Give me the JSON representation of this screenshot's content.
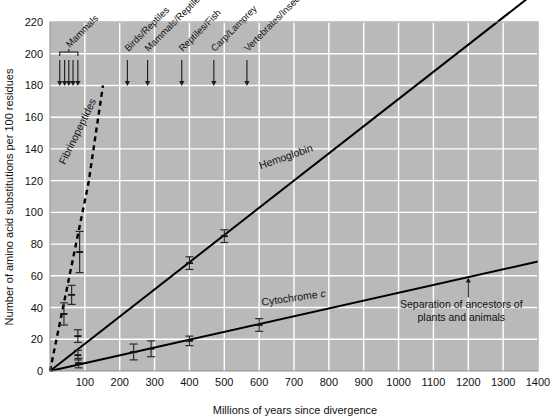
{
  "chart_data": {
    "type": "line",
    "title": "",
    "xlabel": "Millions of years since divergence",
    "ylabel": "Number of amino acid substitutions per 100 residues",
    "xlim": [
      0,
      1400
    ],
    "ylim": [
      0,
      220
    ],
    "xticks": [
      0,
      100,
      200,
      300,
      400,
      500,
      600,
      700,
      800,
      900,
      1000,
      1100,
      1200,
      1300,
      1400
    ],
    "xticklabels": [
      "",
      "100",
      "200",
      "300",
      "400",
      "500",
      "600",
      "700",
      "800",
      "900",
      "1000",
      "1100",
      "1200",
      "1300",
      "1400"
    ],
    "yticks": [
      0,
      20,
      40,
      60,
      80,
      100,
      120,
      140,
      160,
      180,
      200,
      220
    ],
    "yticklabels": [
      "0",
      "20",
      "40",
      "60",
      "80",
      "100",
      "120",
      "140",
      "160",
      "180",
      "200",
      "220"
    ],
    "grid": true,
    "grid_color": "#ffffff",
    "plot_bg": "#b9b9b9",
    "legend_position": "inline-labels",
    "series": [
      {
        "name": "Fibrinopeptides",
        "label": "Fibrinopeptides",
        "style": "dashed",
        "color": "#000000",
        "line": [
          [
            0,
            0
          ],
          [
            110,
            118
          ],
          [
            152,
            180
          ]
        ],
        "label_x": 88,
        "label_y": 150,
        "label_rotation": -64
      },
      {
        "name": "Hemoglobin",
        "label": "Hemoglobin",
        "style": "solid",
        "color": "#000000",
        "line": [
          [
            0,
            0
          ],
          [
            1400,
            240
          ]
        ],
        "label_x": 680,
        "label_y": 133,
        "label_rotation": -19,
        "points": [
          {
            "x": 40,
            "y": 36,
            "err": 7
          },
          {
            "x": 62,
            "y": 48,
            "err": 6
          },
          {
            "x": 85,
            "y": 75,
            "err": 13
          },
          {
            "x": 400,
            "y": 68,
            "err": 4
          },
          {
            "x": 500,
            "y": 85,
            "err": 4
          }
        ]
      },
      {
        "name": "Cytochrome c",
        "label": "Cytochrome c",
        "style": "solid",
        "color": "#000000",
        "line": [
          [
            0,
            0
          ],
          [
            1400,
            69
          ]
        ],
        "label_x": 700,
        "label_y": 44,
        "label_rotation": -8,
        "points": [
          {
            "x": 82,
            "y": 5,
            "err": 3
          },
          {
            "x": 240,
            "y": 12,
            "err": 5
          },
          {
            "x": 290,
            "y": 14,
            "err": 5
          },
          {
            "x": 400,
            "y": 19,
            "err": 3
          },
          {
            "x": 600,
            "y": 29,
            "err": 4
          }
        ]
      },
      {
        "name": "Fibrinopeptides data",
        "label": "",
        "style": "points",
        "color": "#000000",
        "points": [
          {
            "x": 80,
            "y": 22,
            "err": 4
          },
          {
            "x": 80,
            "y": 10,
            "err": 3
          }
        ]
      }
    ],
    "divergence_markers": [
      {
        "label": "Mammals",
        "x_values": [
          28,
          42,
          54,
          66,
          80
        ],
        "bracket": true,
        "label_rotation": -45
      },
      {
        "label": "Birds/Reptiles",
        "x_values": [
          222
        ],
        "bracket": false,
        "label_rotation": -45
      },
      {
        "label": "Mammals/Reptiles",
        "x_values": [
          280
        ],
        "bracket": false,
        "label_rotation": -45
      },
      {
        "label": "Reptiles/Fish",
        "x_values": [
          378
        ],
        "bracket": false,
        "label_rotation": -45
      },
      {
        "label": "Carp/Lamprey",
        "x_values": [
          470
        ],
        "bracket": false,
        "label_rotation": -45
      },
      {
        "label": "Vertebrates/Insects",
        "x_values": [
          565
        ],
        "bracket": false,
        "label_rotation": -45
      }
    ],
    "annotations": [
      {
        "text_line1": "Separation of ancestors of",
        "text_line2": "plants and animals",
        "pointer_x": 1200,
        "pointer_y": 59,
        "text_x": 1180,
        "text_y": 40
      }
    ]
  }
}
